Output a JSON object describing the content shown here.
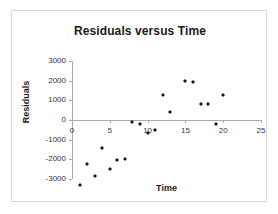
{
  "chart_data": {
    "type": "scatter",
    "title": "Residuals versus Time",
    "xlabel": "Time",
    "ylabel": "Residuals",
    "xlim": [
      0,
      25
    ],
    "ylim": [
      -3000,
      3000
    ],
    "xticks": [
      "0",
      "5",
      "10",
      "15",
      "20",
      "25"
    ],
    "xtick_values": [
      0,
      5,
      10,
      15,
      20,
      25
    ],
    "yticks": [
      "3000",
      "2000",
      "1000",
      "0",
      "-1000",
      "-2000",
      "-3000"
    ],
    "ytick_values": [
      3000,
      2000,
      1000,
      0,
      -1000,
      -2000,
      -3000
    ],
    "grid": false,
    "legend": null,
    "series": [
      {
        "name": "Residuals",
        "marker": "diamond",
        "color": "#1a1a1a",
        "points": [
          {
            "x": 1,
            "y": -2800
          },
          {
            "x": 2,
            "y": -1750
          },
          {
            "x": 3,
            "y": -2350
          },
          {
            "x": 4,
            "y": -900
          },
          {
            "x": 5,
            "y": -1975
          },
          {
            "x": 6,
            "y": -1500
          },
          {
            "x": 7,
            "y": -1450
          },
          {
            "x": 8,
            "y": 400
          },
          {
            "x": 9,
            "y": 330
          },
          {
            "x": 10,
            "y": -130
          },
          {
            "x": 11,
            "y": 10
          },
          {
            "x": 12,
            "y": 1800
          },
          {
            "x": 13,
            "y": 890
          },
          {
            "x": 15,
            "y": 2500
          },
          {
            "x": 16,
            "y": 2460
          },
          {
            "x": 17,
            "y": 1340
          },
          {
            "x": 18,
            "y": 1330
          },
          {
            "x": 19,
            "y": 310
          },
          {
            "x": 20,
            "y": 1780
          }
        ]
      }
    ]
  }
}
